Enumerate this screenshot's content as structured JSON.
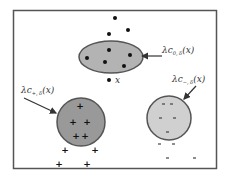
{
  "diagram": {
    "type": "cluster illustration",
    "frame": {
      "x": 13,
      "y": 10,
      "width": 204,
      "height": 159,
      "stroke": "#555555"
    },
    "regions": [
      {
        "id": "c0",
        "shape": "ellipse",
        "label_main": "λc",
        "label_sub": "0, δ",
        "label_tail": "(x)",
        "fill": "#b3b3b3",
        "stroke": "#555555",
        "marker": "dot"
      },
      {
        "id": "c_plus",
        "shape": "circle",
        "label_main": "λc",
        "label_sub": "+, δ",
        "label_tail": "(x)",
        "fill": "#999999",
        "stroke": "#555555",
        "marker": "plus"
      },
      {
        "id": "c_minus",
        "shape": "circle",
        "label_main": "λc",
        "label_sub": "−, δ",
        "label_tail": "(x)",
        "fill": "#d0d0d0",
        "stroke": "#555555",
        "marker": "minus"
      }
    ],
    "point_label": "x"
  }
}
